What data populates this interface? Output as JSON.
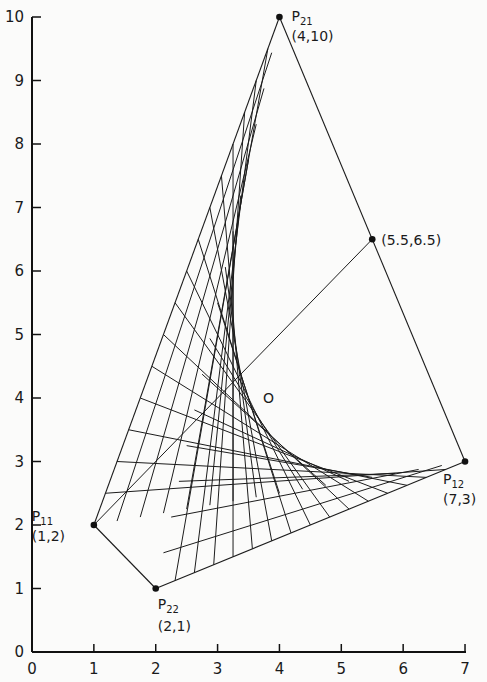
{
  "chart_data": {
    "type": "diagram",
    "title": "",
    "xlabel": "",
    "ylabel": "",
    "xlim": [
      0,
      7
    ],
    "ylim": [
      0,
      10
    ],
    "x_ticks": [
      "0",
      "1",
      "2",
      "3",
      "4",
      "5",
      "6",
      "7"
    ],
    "y_ticks": [
      "0",
      "1",
      "2",
      "3",
      "4",
      "5",
      "6",
      "7",
      "8",
      "9",
      "10"
    ],
    "grid": false,
    "points": [
      {
        "id": "P11",
        "name": "P",
        "sub": "11",
        "coords_label": "(1,2)",
        "x": 1,
        "y": 2
      },
      {
        "id": "P12",
        "name": "P",
        "sub": "12",
        "coords_label": "(7,3)",
        "x": 7,
        "y": 3
      },
      {
        "id": "P21",
        "name": "P",
        "sub": "21",
        "coords_label": "(4,10)",
        "x": 4,
        "y": 10
      },
      {
        "id": "P22",
        "name": "P",
        "sub": "22",
        "coords_label": "(2,1)",
        "x": 2,
        "y": 1
      },
      {
        "id": "M",
        "name": "",
        "sub": "",
        "coords_label": "(5.5,6.5)",
        "x": 5.5,
        "y": 6.5
      }
    ],
    "center_label": "O",
    "center": {
      "x": 3.25,
      "y": 4.0
    },
    "outline_segments": [
      [
        "P11",
        "P22"
      ],
      [
        "P21",
        "P12"
      ],
      [
        "P11",
        "P21"
      ],
      [
        "P22",
        "P12"
      ]
    ],
    "diagonal": {
      "from": "P11",
      "to": "M"
    },
    "ruling_count": 16
  },
  "axes": {
    "origin_label": "0",
    "x_origin_label": "0"
  }
}
